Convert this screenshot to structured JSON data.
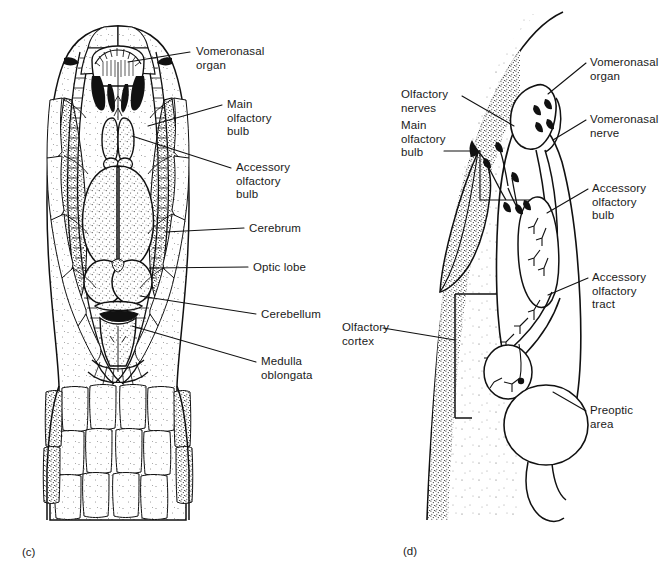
{
  "figure": {
    "ink_color": "#111111",
    "background_color": "#ffffff",
    "stipple_color": "#333333"
  },
  "panels": [
    {
      "id": "c",
      "letter": "(c)",
      "caption_x": 22,
      "caption_y": 546,
      "view": "dorsal view of snake head with brain exposed",
      "labels": [
        {
          "name": "vomeronasal-organ",
          "lines": [
            "Vomeronasal",
            "organ"
          ],
          "text_x": 196,
          "text_y": 45,
          "leader": [
            [
              190,
              52
            ],
            [
              128,
              62
            ]
          ]
        },
        {
          "name": "main-olfactory-bulb",
          "lines": [
            "Main",
            "olfactory",
            "bulb"
          ],
          "text_x": 227,
          "text_y": 98,
          "leader": [
            [
              222,
              105
            ],
            [
              148,
              126
            ]
          ]
        },
        {
          "name": "accessory-olfactory-bulb",
          "lines": [
            "Accessory",
            "olfactory",
            "bulb"
          ],
          "text_x": 236,
          "text_y": 161,
          "leader": [
            [
              231,
              168
            ],
            [
              132,
              136
            ]
          ]
        },
        {
          "name": "cerebrum",
          "lines": [
            "Cerebrum"
          ],
          "text_x": 249,
          "text_y": 222,
          "leader": [
            [
              244,
              228
            ],
            [
              165,
              232
            ]
          ]
        },
        {
          "name": "optic-lobe",
          "lines": [
            "Optic lobe"
          ],
          "text_x": 253,
          "text_y": 261,
          "leader": [
            [
              248,
              267
            ],
            [
              150,
              268
            ]
          ]
        },
        {
          "name": "cerebellum",
          "lines": [
            "Cerebellum"
          ],
          "text_x": 261,
          "text_y": 308,
          "leader": [
            [
              256,
              314
            ],
            [
              140,
              296
            ]
          ]
        },
        {
          "name": "medulla-oblongata",
          "lines": [
            "Medulla",
            "oblongata"
          ],
          "text_x": 261,
          "text_y": 355,
          "leader": [
            [
              256,
              362
            ],
            [
              132,
              326
            ]
          ]
        }
      ]
    },
    {
      "id": "d",
      "letter": "(d)",
      "caption_x": 403,
      "caption_y": 545,
      "view": "lateral schematic of olfactory pathways",
      "labels": [
        {
          "name": "olfactory-nerves",
          "lines": [
            "Olfactory",
            "nerves"
          ],
          "text_x": 401,
          "text_y": 88,
          "align": "left",
          "leader": [
            [
              462,
              96
            ],
            [
              514,
              126
            ]
          ]
        },
        {
          "name": "main-olfactory-bulb",
          "lines": [
            "Main",
            "olfactory",
            "bulb"
          ],
          "text_x": 401,
          "text_y": 119,
          "align": "left",
          "leader": [
            [
              444,
              151
            ],
            [
              530,
              178
            ]
          ]
        },
        {
          "name": "vomeronasal-organ",
          "lines": [
            "Vomeronasal",
            "organ"
          ],
          "text_x": 590,
          "text_y": 56,
          "leader": [
            [
              586,
              63
            ],
            [
              548,
              94
            ]
          ]
        },
        {
          "name": "vomeronasal-nerve",
          "lines": [
            "Vomeronasal",
            "nerve"
          ],
          "text_x": 590,
          "text_y": 113,
          "leader": [
            [
              586,
              120
            ],
            [
              553,
              140
            ]
          ]
        },
        {
          "name": "accessory-olfactory-bulb",
          "lines": [
            "Accessory",
            "olfactory",
            "bulb"
          ],
          "text_x": 592,
          "text_y": 182,
          "leader": [
            [
              588,
              189
            ],
            [
              547,
              213
            ]
          ]
        },
        {
          "name": "accessory-olfactory-tract",
          "lines": [
            "Accessory",
            "olfactory",
            "tract"
          ],
          "text_x": 592,
          "text_y": 271,
          "leader": [
            [
              588,
              278
            ],
            [
              548,
              295
            ]
          ]
        },
        {
          "name": "olfactory-cortex",
          "lines": [
            "Olfactory",
            "cortex"
          ],
          "text_x": 342,
          "text_y": 321,
          "align": "left",
          "leader": [
            [
              383,
              328
            ],
            [
              454,
              340
            ]
          ]
        },
        {
          "name": "preoptic-area",
          "lines": [
            "Preoptic",
            "area"
          ],
          "text_x": 590,
          "text_y": 404,
          "leader": [
            [
              586,
              411
            ],
            [
              553,
              392
            ]
          ]
        }
      ]
    }
  ]
}
